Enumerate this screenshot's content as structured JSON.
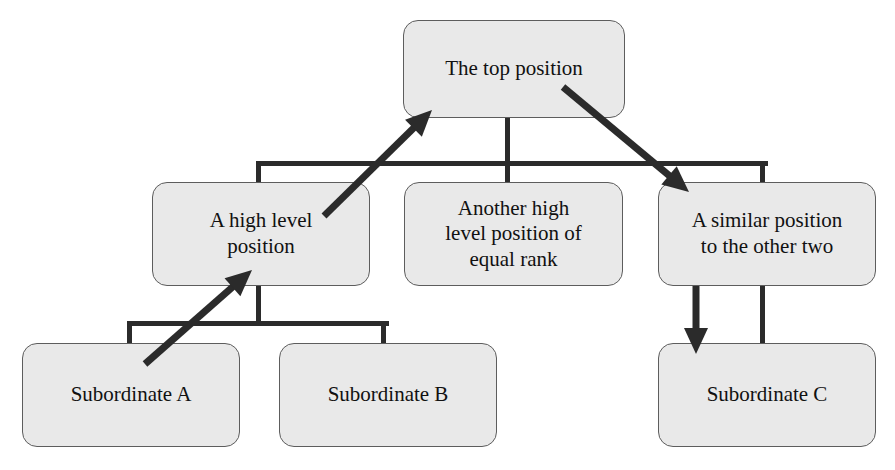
{
  "diagram": {
    "type": "organizational-chart",
    "background_color": "#ffffff",
    "node_fill_color": "#e9e9e9",
    "node_border_color": "#5d5d5d",
    "connector_color": "#2b2b2b",
    "arrow_color": "#2b2b2b",
    "text_color": "#111111",
    "nodes": [
      {
        "id": "top",
        "label": "The top position",
        "level": 0,
        "x": 403,
        "y": 20,
        "width": 222,
        "height": 98
      },
      {
        "id": "high-level",
        "label": "A high level\nposition",
        "level": 1,
        "x": 152,
        "y": 182,
        "width": 218,
        "height": 104
      },
      {
        "id": "another-high-level",
        "label": "Another high\nlevel position of\nequal rank",
        "level": 1,
        "x": 404,
        "y": 182,
        "width": 219,
        "height": 104
      },
      {
        "id": "similar-position",
        "label": "A similar position\nto the other two",
        "level": 1,
        "x": 658,
        "y": 182,
        "width": 218,
        "height": 104
      },
      {
        "id": "subordinate-a",
        "label": "Subordinate A",
        "level": 2,
        "x": 22,
        "y": 343,
        "width": 218,
        "height": 104
      },
      {
        "id": "subordinate-b",
        "label": "Subordinate B",
        "level": 2,
        "x": 279,
        "y": 343,
        "width": 218,
        "height": 104
      },
      {
        "id": "subordinate-c",
        "label": "Subordinate C",
        "level": 2,
        "x": 658,
        "y": 343,
        "width": 218,
        "height": 104
      }
    ],
    "connectors": [
      {
        "id": "top-stem",
        "orientation": "vertical",
        "x": 508,
        "y": 118,
        "length": 46,
        "thickness": 5
      },
      {
        "id": "level1-bus",
        "orientation": "horizontal",
        "x": 259,
        "y": 161,
        "length": 509,
        "thickness": 5
      },
      {
        "id": "drop-left",
        "orientation": "vertical",
        "x": 259,
        "y": 161,
        "length": 23,
        "thickness": 5
      },
      {
        "id": "drop-middle",
        "orientation": "vertical",
        "x": 508,
        "y": 161,
        "length": 23,
        "thickness": 5
      },
      {
        "id": "drop-right",
        "orientation": "vertical",
        "x": 763,
        "y": 161,
        "length": 23,
        "thickness": 5
      },
      {
        "id": "left-stem",
        "orientation": "vertical",
        "x": 259,
        "y": 286,
        "length": 40,
        "thickness": 5
      },
      {
        "id": "level2-bus",
        "orientation": "horizontal",
        "x": 130,
        "y": 321,
        "length": 259,
        "thickness": 5
      },
      {
        "id": "drop-sub-a",
        "orientation": "vertical",
        "x": 130,
        "y": 321,
        "length": 24,
        "thickness": 5
      },
      {
        "id": "drop-sub-b",
        "orientation": "vertical",
        "x": 384,
        "y": 321,
        "length": 24,
        "thickness": 5
      },
      {
        "id": "drop-sub-c",
        "orientation": "vertical",
        "x": 763,
        "y": 286,
        "length": 59,
        "thickness": 5
      }
    ],
    "arrows": [
      {
        "id": "arrow-to-top-position",
        "from_x": 324,
        "from_y": 216,
        "to_x": 432,
        "to_y": 110,
        "thickness": 7,
        "points_to": "top"
      },
      {
        "id": "arrow-to-similar-position",
        "from_x": 563,
        "from_y": 87,
        "to_x": 689,
        "to_y": 192,
        "thickness": 7,
        "points_to": "similar-position"
      },
      {
        "id": "arrow-to-high-level-position",
        "from_x": 145,
        "from_y": 364,
        "to_x": 252,
        "to_y": 270,
        "thickness": 7,
        "points_to": "high-level"
      },
      {
        "id": "arrow-to-subordinate-c",
        "from_x": 696,
        "from_y": 286,
        "to_x": 696,
        "to_y": 354,
        "thickness": 7,
        "points_to": "subordinate-c"
      }
    ]
  }
}
